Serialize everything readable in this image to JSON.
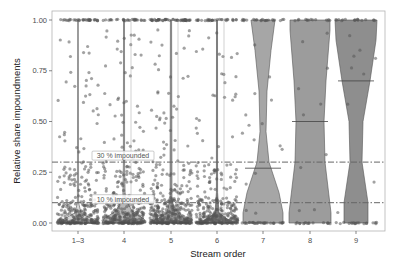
{
  "chart_data": {
    "type": "violin",
    "title": "",
    "xlabel": "Stream order",
    "ylabel": "Relative share impoundments",
    "categories": [
      "1–3",
      "4",
      "5",
      "6",
      "7",
      "8",
      "9"
    ],
    "ylim": [
      0,
      1
    ],
    "yticks": [
      "0.00",
      "0.25",
      "0.50",
      "0.75",
      "1.00"
    ],
    "ytick_values": [
      0,
      0.25,
      0.5,
      0.75,
      1.0
    ],
    "grid": false,
    "legend": null,
    "medians": [
      0.0,
      0.0,
      0.0,
      0.0,
      0.27,
      0.5,
      0.7
    ],
    "violin_fill": [
      "#d9d9d9",
      "#b8b8b8",
      "#9a9a9a",
      "#7c7c7c",
      "#a6a6a6",
      "#9c9c9c",
      "#8e8e8e"
    ],
    "reference_lines": [
      {
        "value": 0.3,
        "label": "30 % impounded",
        "style": "dashdot"
      },
      {
        "value": 0.1,
        "label": "10 % impounded",
        "style": "dashdot"
      }
    ],
    "jitter_points": "dense near 0 for orders 1–6; sparse spread across 0–1; concentrated at 0 and 1 for orders 7–9"
  }
}
